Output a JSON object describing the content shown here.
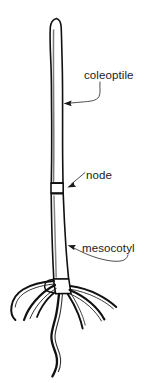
{
  "figure": {
    "background_color": "#ffffff",
    "ink_color": "#111111",
    "label_color": "#1a1a1a",
    "leader_color": "#3a3a3a",
    "width": 161,
    "height": 383
  },
  "labels": {
    "coleoptile": "coleoptile",
    "node": "node",
    "mesocotyl": "mesocotyl"
  },
  "structures": {
    "coleoptile_name": "coleoptile-shoot",
    "node_name": "node-band",
    "mesocotyl_name": "mesocotyl-stem",
    "collar_name": "seed-collar",
    "roots_name": "seminal-roots"
  }
}
